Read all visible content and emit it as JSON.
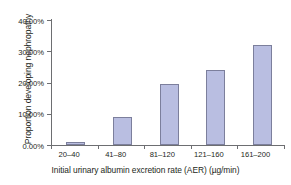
{
  "chart_data": {
    "type": "bar",
    "title": "",
    "xlabel": "Initial urinary albumin excretion rate (AER) (µg/min)",
    "ylabel": "Proportion developing nephropathy",
    "categories": [
      "20–40",
      "41–80",
      "81–120",
      "121–160",
      "161–200"
    ],
    "values": [
      1.0,
      9.0,
      19.5,
      24.0,
      32.0
    ],
    "ylim": [
      0,
      40
    ],
    "ytick_values": [
      0,
      10,
      20,
      30,
      40
    ],
    "ytick_labels": [
      "0.00%",
      "10.00%",
      "20.00%",
      "30.00%",
      "40.00%"
    ],
    "grid": false,
    "legend": false,
    "bar_fill_color": "#b9bee1",
    "bar_border_color": "#7c7f9c",
    "axis_color": "#6d6e71",
    "text_color": "#231f20",
    "background_color": "#ffffff"
  }
}
